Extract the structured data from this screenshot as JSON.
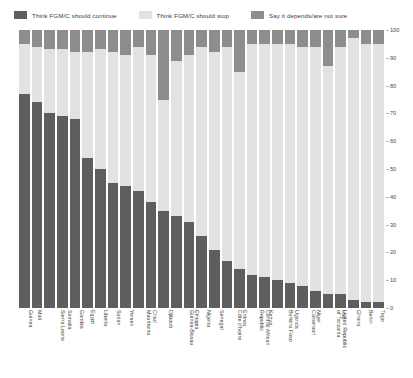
{
  "legend": {
    "items": [
      {
        "label": "Think FGM/C should continue",
        "color": "#5e5e5e",
        "key": "continue"
      },
      {
        "label": "Think FGM/C should stop",
        "color": "#e2e2e2",
        "key": "stop"
      },
      {
        "label": "Say it depends/are not sure",
        "color": "#8d8d8d",
        "key": "depends"
      }
    ]
  },
  "chart_data": {
    "type": "bar",
    "title": "",
    "subtitle": "",
    "xlabel": "",
    "ylabel": "",
    "ylim": [
      0,
      100
    ],
    "yticks": [
      0,
      10,
      20,
      30,
      40,
      50,
      60,
      70,
      80,
      90,
      100
    ],
    "grid": false,
    "stacked": true,
    "legend_position": "top",
    "categories": [
      "Guinea",
      "Mali",
      "Sierra Leone",
      "Somalia",
      "Gambia",
      "Egypt",
      "Liberia",
      "Sudan",
      "Yemen",
      "Mauritania",
      "Chad",
      "Djibouti",
      "Guinea-Bissau",
      "Ethiopia",
      "Nigeria",
      "Senegal",
      "Côte d'Ivoire",
      "Eritrea",
      "Central African Republic",
      "Kenya",
      "Burkina Faso",
      "Uganda",
      "Cameroon",
      "Niger",
      "United Republic of Tanzania",
      "Iraq",
      "Ghana",
      "Benin",
      "Togo"
    ],
    "series": [
      {
        "name": "Think FGM/C should continue",
        "key": "continue",
        "color": "#5e5e5e",
        "values": [
          77,
          74,
          70,
          69,
          68,
          54,
          50,
          45,
          44,
          42,
          38,
          35,
          33,
          31,
          26,
          21,
          17,
          14,
          12,
          11,
          10,
          9,
          8,
          6,
          5,
          5,
          3,
          2,
          2
        ]
      },
      {
        "name": "Think FGM/C should stop",
        "key": "stop",
        "color": "#e2e2e2",
        "values": [
          18,
          20,
          23,
          24,
          24,
          38,
          43,
          47,
          47,
          52,
          53,
          40,
          56,
          60,
          68,
          71,
          77,
          71,
          83,
          84,
          85,
          86,
          86,
          88,
          82,
          89,
          94,
          93,
          93
        ]
      },
      {
        "name": "Say it depends/are not sure",
        "key": "depends",
        "color": "#8d8d8d",
        "values": [
          5,
          6,
          7,
          7,
          8,
          8,
          7,
          8,
          9,
          6,
          9,
          25,
          11,
          9,
          6,
          8,
          6,
          15,
          5,
          5,
          5,
          5,
          6,
          6,
          13,
          6,
          3,
          5,
          5
        ]
      }
    ]
  }
}
